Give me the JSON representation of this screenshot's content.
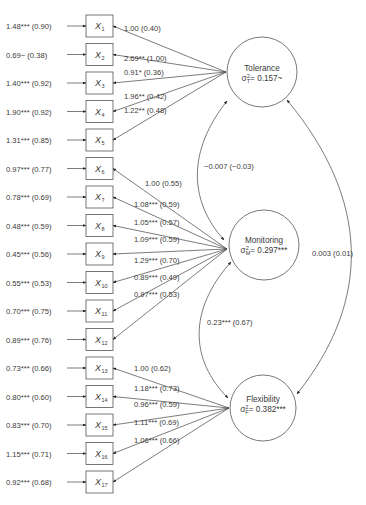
{
  "diagram": {
    "type": "structural-equation-model",
    "indicators": [
      {
        "id": "X1",
        "label": "X",
        "sub": "1",
        "residual": "1.48*** (0.90)",
        "factor": "tolerance",
        "loading": "1.00 (0.40)"
      },
      {
        "id": "X2",
        "label": "X",
        "sub": "2",
        "residual": "0.69~   (0.38)",
        "factor": "tolerance",
        "loading": "2.69** (1.00)"
      },
      {
        "id": "X3",
        "label": "X",
        "sub": "3",
        "residual": "1.40*** (0.92)",
        "factor": "tolerance",
        "loading": "0.91* (0.36)"
      },
      {
        "id": "X4",
        "label": "X",
        "sub": "4",
        "residual": "1.90*** (0.92)",
        "factor": "tolerance",
        "loading": "1.96** (0.42)"
      },
      {
        "id": "X5",
        "label": "X",
        "sub": "5",
        "residual": "1.31*** (0.85)",
        "factor": "tolerance",
        "loading": "1.22** (0.48)"
      },
      {
        "id": "X6",
        "label": "X",
        "sub": "6",
        "residual": "0.97*** (0.77)",
        "factor": "monitoring",
        "loading": "1.00 (0.55)"
      },
      {
        "id": "X7",
        "label": "X",
        "sub": "7",
        "residual": "0.78*** (0.69)",
        "factor": "monitoring",
        "loading": "1.08*** (0.59)"
      },
      {
        "id": "X8",
        "label": "X",
        "sub": "8",
        "residual": "0.48*** (0.59)",
        "factor": "monitoring",
        "loading": "1.05*** (0.57)"
      },
      {
        "id": "X9",
        "label": "X",
        "sub": "9",
        "residual": "0.45*** (0.56)",
        "factor": "monitoring",
        "loading": "1.09*** (0.59)"
      },
      {
        "id": "X10",
        "label": "X",
        "sub": "10",
        "residual": "0.55*** (0.53)",
        "factor": "monitoring",
        "loading": "1.29*** (0.70)"
      },
      {
        "id": "X11",
        "label": "X",
        "sub": "11",
        "residual": "0.70*** (0.75)",
        "factor": "monitoring",
        "loading": "0.89*** (0.49)"
      },
      {
        "id": "X12",
        "label": "X",
        "sub": "12",
        "residual": "0.89*** (0.76)",
        "factor": "monitoring",
        "loading": "0.97*** (0.53)"
      },
      {
        "id": "X13",
        "label": "X",
        "sub": "13",
        "residual": "0.73*** (0.66)",
        "factor": "flexibility",
        "loading": "1.00 (0.62)"
      },
      {
        "id": "X14",
        "label": "X",
        "sub": "14",
        "residual": "0.80*** (0.60)",
        "factor": "flexibility",
        "loading": "1.18*** (0.73)"
      },
      {
        "id": "X15",
        "label": "X",
        "sub": "15",
        "residual": "0.83*** (0.70)",
        "factor": "flexibility",
        "loading": "0.96*** (0.59)"
      },
      {
        "id": "X16",
        "label": "X",
        "sub": "16",
        "residual": "1.15*** (0.71)",
        "factor": "flexibility",
        "loading": "1.11*** (0.69)"
      },
      {
        "id": "X17",
        "label": "X",
        "sub": "17",
        "residual": "0.92*** (0.68)",
        "factor": "flexibility",
        "loading": "1.06*** (0.66)"
      }
    ],
    "factors": {
      "tolerance": {
        "name": "Tolerance",
        "var_symbol": "σ",
        "var_sup": "2",
        "var_sub": "T",
        "var_value": "= 0.157~"
      },
      "monitoring": {
        "name": "Monitoring",
        "var_symbol": "σ",
        "var_sup": "2",
        "var_sub": "M",
        "var_value": "= 0.297***"
      },
      "flexibility": {
        "name": "Flexibility",
        "var_symbol": "σ",
        "var_sup": "2",
        "var_sub": "F",
        "var_value": "= 0.382***"
      }
    },
    "covariances": {
      "tolerance_monitoring": "−0.007 (−0.03)",
      "monitoring_flexibility": "0.23*** (0.67)",
      "tolerance_flexibility": "0.003 (0.01)"
    },
    "colors": {
      "stroke": "#555555",
      "text": "#3a3a3a",
      "background": "#ffffff"
    }
  }
}
